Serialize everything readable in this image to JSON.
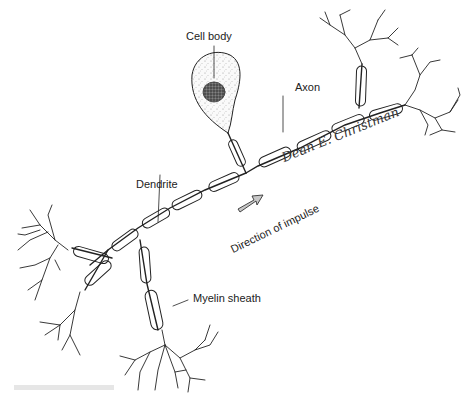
{
  "labels": {
    "cell_body": "Cell body",
    "axon": "Axon",
    "dendrite": "Dendrite",
    "myelin_sheath": "Myelin sheath",
    "direction": "Direction of impulse"
  },
  "signature": "Dean E. Christman",
  "colors": {
    "line": "#222222",
    "arrow_fill": "#c8c8c8",
    "cell_fill": "#f2f2f2",
    "nucleus": "#555555"
  }
}
